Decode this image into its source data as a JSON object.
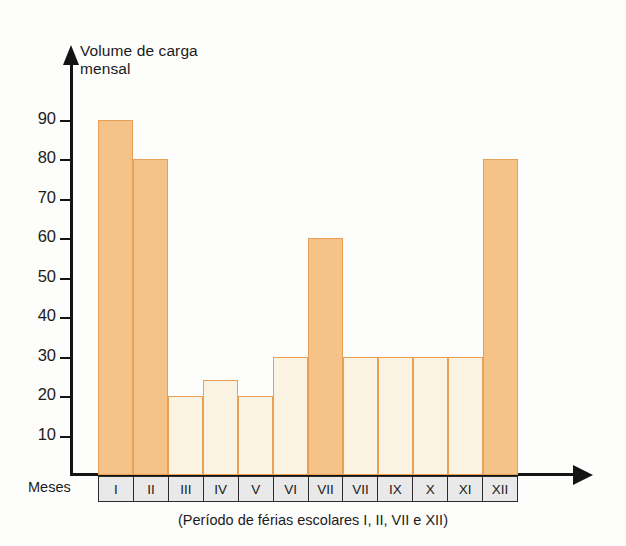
{
  "chart_data": {
    "type": "bar",
    "title": "Volume de carga mensal",
    "xlabel": "Meses",
    "ylabel": "Volume de carga mensal",
    "categories": [
      "I",
      "II",
      "III",
      "IV",
      "V",
      "VI",
      "VII",
      "VII",
      "IX",
      "X",
      "XI",
      "XII"
    ],
    "values": [
      90,
      80,
      20,
      24,
      20,
      30,
      60,
      30,
      30,
      30,
      30,
      80
    ],
    "ylim": [
      0,
      95
    ],
    "yticks": [
      90,
      80,
      70,
      60,
      50,
      40,
      30,
      20,
      10
    ],
    "ytick_labels": [
      "90",
      "80",
      "70",
      "60",
      "50",
      "40",
      "30",
      "20",
      "10"
    ],
    "grid": false,
    "legend": "none",
    "highlighted_categories": [
      "I",
      "II",
      "VII",
      "XII"
    ],
    "highlight_note": "(Período de férias escolares I, II, VII e XII)",
    "bars": [
      {
        "category": "I",
        "value": 90,
        "holiday": true
      },
      {
        "category": "II",
        "value": 80,
        "holiday": true
      },
      {
        "category": "III",
        "value": 20,
        "holiday": false
      },
      {
        "category": "IV",
        "value": 24,
        "holiday": false
      },
      {
        "category": "V",
        "value": 20,
        "holiday": false
      },
      {
        "category": "VI",
        "value": 30,
        "holiday": false
      },
      {
        "category": "VII",
        "value": 60,
        "holiday": true
      },
      {
        "category": "VII",
        "value": 30,
        "holiday": false
      },
      {
        "category": "IX",
        "value": 30,
        "holiday": false
      },
      {
        "category": "X",
        "value": 30,
        "holiday": false
      },
      {
        "category": "XI",
        "value": 30,
        "holiday": false
      },
      {
        "category": "XII",
        "value": 80,
        "holiday": true
      }
    ],
    "colors": {
      "holiday_fill": "#f5c288",
      "regular_fill": "#faf3e2",
      "bar_border": "#e8a056",
      "axis": "#141414",
      "month_cell_fill": "#e9e9e9",
      "month_cell_border": "#2b2b2b",
      "background": "#fdfdfb",
      "text": "#1b1b1b"
    }
  },
  "axis": {
    "title_line1": "Volume de carga",
    "title_line2": "mensal",
    "x_label": "Meses"
  },
  "caption": {
    "text": "(Período de férias escolares I, II, VII e XII)"
  }
}
